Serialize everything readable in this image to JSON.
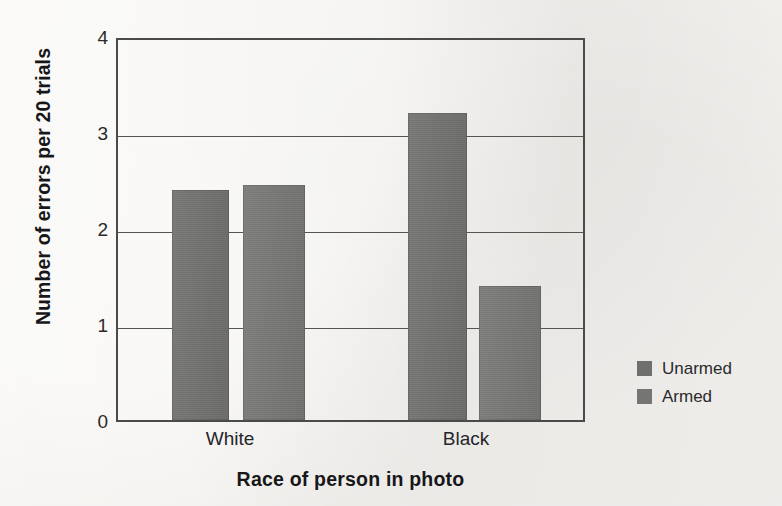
{
  "chart_data": {
    "type": "bar",
    "title": "",
    "xlabel": "Race of person in photo",
    "ylabel": "Number of errors per 20 trials",
    "categories": [
      "White",
      "Black"
    ],
    "series": [
      {
        "name": "Unarmed",
        "values": [
          2.4,
          3.2
        ],
        "color": "#6f6f6d"
      },
      {
        "name": "Armed",
        "values": [
          2.45,
          1.4
        ],
        "color": "#757573"
      }
    ],
    "ylim": [
      0,
      4
    ],
    "yticks": [
      0,
      1,
      2,
      3,
      4
    ],
    "ytick_labels": [
      "0",
      "1",
      "2",
      "3",
      "4"
    ],
    "grid": "horizontal",
    "legend_position": "right",
    "background": "#f4f2ef",
    "axis_color": "#4a4a48"
  },
  "axes": {
    "y_label": "Number of errors per 20 trials",
    "x_label": "Race of person in photo",
    "y_ticks": [
      "0",
      "1",
      "2",
      "3",
      "4"
    ],
    "x_ticks": [
      "White",
      "Black"
    ]
  },
  "legend": {
    "items": [
      {
        "label": "Unarmed",
        "swatch": "legend-swatch-unarmed"
      },
      {
        "label": "Armed",
        "swatch": "legend-swatch-armed"
      }
    ]
  }
}
